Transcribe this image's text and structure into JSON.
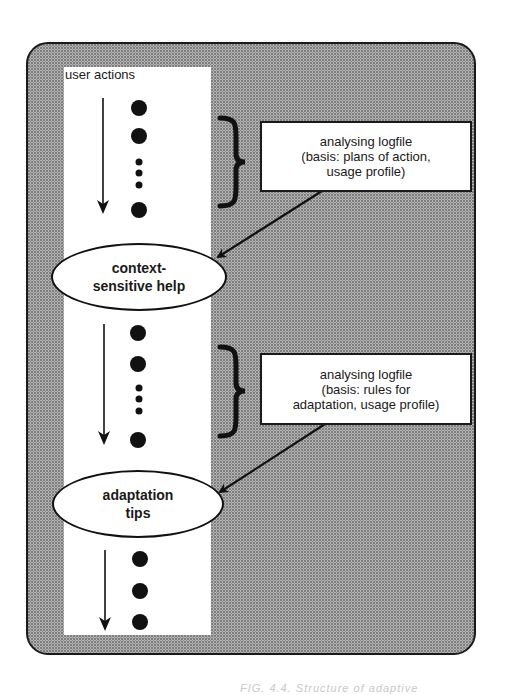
{
  "diagram": {
    "column_label": "user actions",
    "info_boxes": [
      {
        "lines": [
          "analysing logfile",
          "(basis: plans of action,",
          "usage profile)"
        ]
      },
      {
        "lines": [
          "analysing logfile",
          "(basis: rules for",
          "adaptation, usage profile)"
        ]
      }
    ],
    "ellipses": [
      {
        "lines": [
          "context-",
          "sensitive help"
        ]
      },
      {
        "lines": [
          "adaptation",
          "tips"
        ]
      }
    ],
    "action_sequences": [
      {
        "dots": [
          "large",
          "large",
          "small",
          "small",
          "small",
          "large"
        ]
      },
      {
        "dots": [
          "large",
          "large",
          "small",
          "small",
          "small",
          "large"
        ]
      },
      {
        "dots": [
          "large",
          "large",
          "large"
        ]
      }
    ],
    "caption_partial": "FIG. 4.4. Structure of adaptive",
    "colors": {
      "background_stipple": "#a8a8a8",
      "ink": "#1a1a1a",
      "column": "#ffffff"
    }
  }
}
